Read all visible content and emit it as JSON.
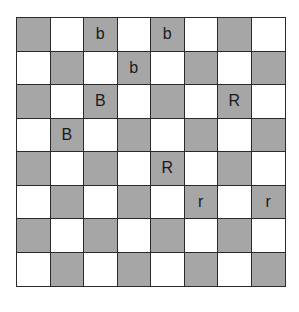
{
  "board": {
    "size": 8,
    "colors": {
      "dark": "#a6a6a6",
      "light": "#ffffff",
      "grid": "#2a2a2a"
    },
    "top_left_dark": true,
    "pieces": [
      {
        "row": 0,
        "col": 2,
        "label": "b"
      },
      {
        "row": 0,
        "col": 4,
        "label": "b"
      },
      {
        "row": 1,
        "col": 3,
        "label": "b"
      },
      {
        "row": 2,
        "col": 2,
        "label": "B"
      },
      {
        "row": 2,
        "col": 6,
        "label": "R"
      },
      {
        "row": 3,
        "col": 1,
        "label": "B"
      },
      {
        "row": 4,
        "col": 4,
        "label": "R"
      },
      {
        "row": 5,
        "col": 5,
        "label": "r"
      },
      {
        "row": 5,
        "col": 7,
        "label": "r"
      }
    ]
  }
}
